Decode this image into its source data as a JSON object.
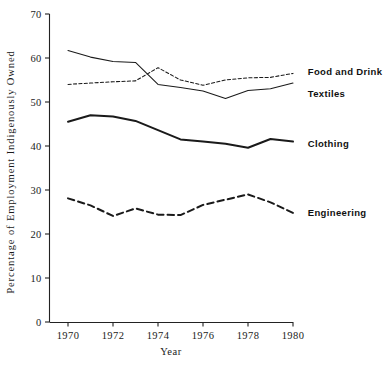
{
  "chart_data": {
    "type": "line",
    "title": "",
    "xlabel": "Year",
    "ylabel": "Percentage of Employment Indigenously Owned",
    "xlim": [
      1969,
      1980.5
    ],
    "ylim": [
      0,
      70
    ],
    "ytick_values": [
      0,
      10,
      20,
      30,
      40,
      50,
      60,
      70
    ],
    "ytick_labels": [
      "0",
      "10",
      "20",
      "30",
      "40",
      "50",
      "60",
      "70"
    ],
    "xtick_values": [
      1970,
      1972,
      1974,
      1976,
      1978,
      1980
    ],
    "xtick_labels": [
      "1970",
      "1972",
      "1974",
      "1976",
      "1978",
      "1980"
    ],
    "grid": false,
    "legend_position": "right-inline",
    "x": [
      1970,
      1971,
      1972,
      1973,
      1974,
      1975,
      1976,
      1977,
      1978,
      1979,
      1980
    ],
    "series": [
      {
        "name": "Food and Drink",
        "style": "dotted-thin",
        "color": "#1a1a1a",
        "values": [
          54.0,
          54.3,
          54.6,
          54.8,
          57.8,
          55.0,
          53.8,
          55.0,
          55.5,
          55.6,
          56.5
        ],
        "label_x": 1980.3,
        "label_y": 57.0
      },
      {
        "name": "Textiles",
        "style": "solid-thin",
        "color": "#1a1a1a",
        "values": [
          61.7,
          60.2,
          59.2,
          59.0,
          54.0,
          53.3,
          52.5,
          50.8,
          52.6,
          53.0,
          54.3
        ],
        "label_x": 1980.3,
        "label_y": 52.0
      },
      {
        "name": "Clothing",
        "style": "solid-thick",
        "color": "#1a1a1a",
        "values": [
          45.5,
          47.0,
          46.7,
          45.7,
          43.6,
          41.5,
          41.0,
          40.5,
          39.6,
          41.6,
          41.0
        ],
        "label_x": 1980.3,
        "label_y": 40.5
      },
      {
        "name": "Engineering",
        "style": "dashed-thick",
        "color": "#1a1a1a",
        "values": [
          28.1,
          26.5,
          24.1,
          25.8,
          24.4,
          24.3,
          26.6,
          27.8,
          29.0,
          27.2,
          24.8
        ],
        "label_x": 1980.3,
        "label_y": 25.0
      }
    ]
  },
  "axes": {
    "y_title": "Percentage of Employment Indigenously Owned",
    "x_title": "Year"
  }
}
